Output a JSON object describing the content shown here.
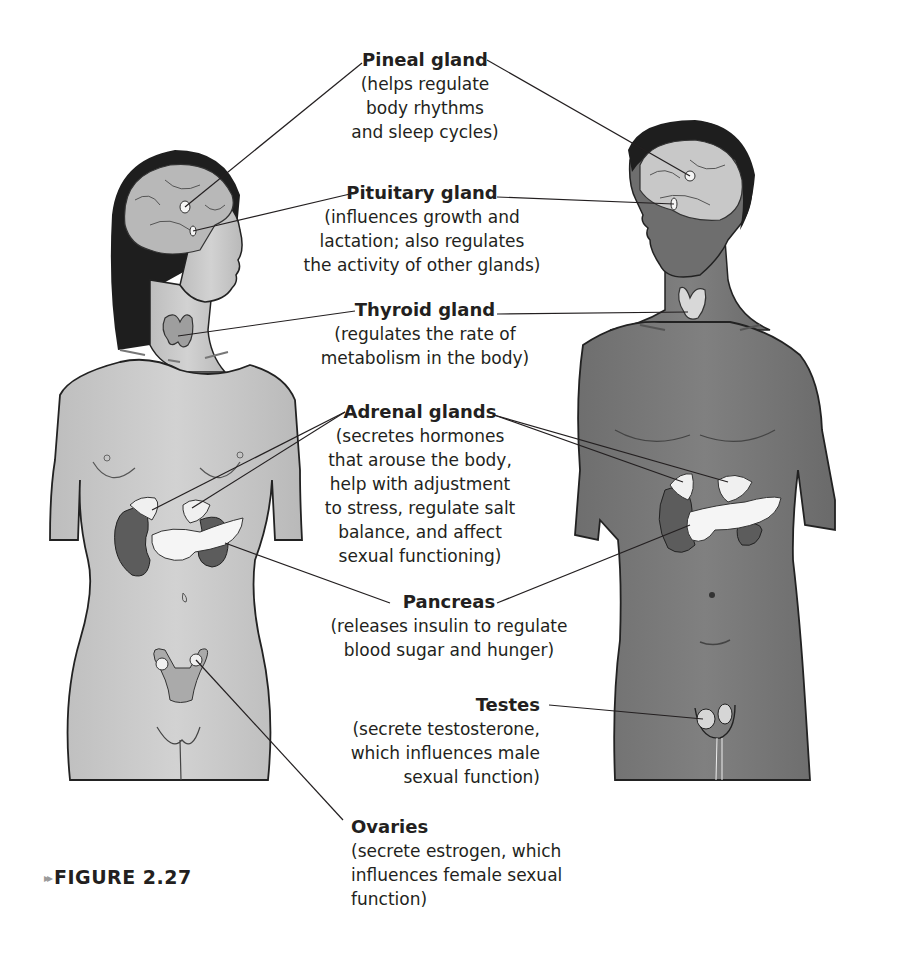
{
  "figure": {
    "caption_marker": "▸▸",
    "caption": "FIGURE 2.27",
    "subjects": [
      "female-figure",
      "male-figure"
    ]
  },
  "labels": {
    "pineal": {
      "title": "Pineal gland",
      "desc": "(helps regulate\nbody rhythms\nand sleep cycles)"
    },
    "pituitary": {
      "title": "Pituitary gland",
      "desc": "(influences growth and\nlactation; also regulates\nthe activity of other glands)"
    },
    "thyroid": {
      "title": "Thyroid gland",
      "desc": "(regulates the rate of\nmetabolism in the body)"
    },
    "adrenal": {
      "title": "Adrenal glands",
      "desc": "(secretes hormones\nthat arouse the body,\nhelp with adjustment\nto stress, regulate salt\nbalance, and affect\nsexual functioning)"
    },
    "pancreas": {
      "title": "Pancreas",
      "desc": "(releases insulin to regulate\nblood sugar and hunger)"
    },
    "testes": {
      "title": "Testes",
      "desc": "(secrete testosterone,\nwhich influences male\nsexual function)"
    },
    "ovaries": {
      "title": "Ovaries",
      "desc": "(secrete estrogen, which\ninfluences female sexual\nfunction)"
    }
  },
  "colors": {
    "female_skin": "#c9c9c9",
    "male_skin": "#7a7a7a",
    "gland": "#f2f2f2",
    "kidney": "#5c5c5c",
    "hair": "#1e1e1e",
    "brain": "#b8b8b8",
    "text": "#231f20"
  }
}
